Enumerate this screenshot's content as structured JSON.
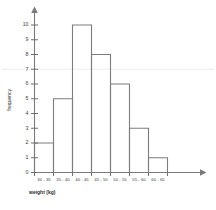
{
  "chart_data": {
    "type": "bar",
    "title": "",
    "subtitle": "",
    "xlabel": "weight (kg)",
    "ylabel": "frequency",
    "categories": [
      "30 - 35",
      "35 - 40",
      "40 - 45",
      "45 - 50",
      "50 - 55",
      "55 - 60",
      "60 - 65"
    ],
    "values": [
      2,
      5,
      10,
      8,
      6,
      3,
      1
    ],
    "series": [
      {
        "name": "frequency",
        "values": [
          2,
          5,
          10,
          8,
          6,
          3,
          1
        ]
      }
    ],
    "ylim": [
      0,
      10
    ],
    "y_ticks": [
      0,
      1,
      2,
      3,
      4,
      5,
      6,
      7,
      8,
      9,
      10
    ],
    "y_tick_labels": [
      "0",
      "1",
      "2",
      "3",
      "4",
      "5",
      "6",
      "7",
      "8",
      "9",
      "10"
    ],
    "grid": true,
    "gridlines_at": [
      7
    ],
    "legend": false,
    "legend_position": "none",
    "bar_style": "outline",
    "bar_gap": 0,
    "axis_arrows": true,
    "annotations": []
  },
  "style": {
    "background_color": "#ffffff",
    "bar_stroke_color": "#7c7c7c",
    "bar_fill_color": "#ffffff",
    "axis_color": "#7a7a7a",
    "gridline_color": "#ececec",
    "text_color": "#3d3d3d"
  }
}
